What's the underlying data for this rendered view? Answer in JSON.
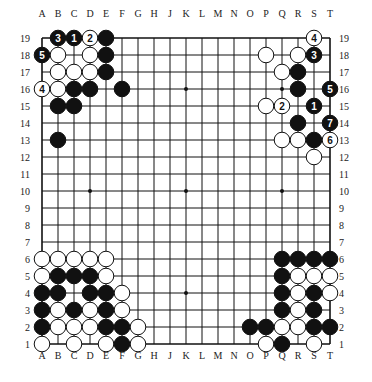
{
  "diagram": {
    "type": "go-board",
    "size": 19,
    "colors": {
      "black": "#111111",
      "white": "#ffffff",
      "line": "#111111",
      "background": "#ffffff"
    },
    "column_labels": [
      "A",
      "B",
      "C",
      "D",
      "E",
      "F",
      "G",
      "H",
      "J",
      "K",
      "L",
      "M",
      "N",
      "O",
      "P",
      "Q",
      "R",
      "S",
      "T"
    ],
    "row_labels": [
      "19",
      "18",
      "17",
      "16",
      "15",
      "14",
      "13",
      "12",
      "11",
      "10",
      "9",
      "8",
      "7",
      "6",
      "5",
      "4",
      "3",
      "2",
      "1"
    ],
    "star_points": [
      "D16",
      "K16",
      "Q16",
      "D10",
      "K10",
      "Q10",
      "D4",
      "K4",
      "Q4"
    ],
    "stones": [
      {
        "pos": "B19",
        "color": "black",
        "label": "3"
      },
      {
        "pos": "C19",
        "color": "black",
        "label": "1"
      },
      {
        "pos": "D19",
        "color": "white",
        "label": "2"
      },
      {
        "pos": "E19",
        "color": "black",
        "label": ""
      },
      {
        "pos": "A18",
        "color": "black",
        "label": "5"
      },
      {
        "pos": "B18",
        "color": "white",
        "label": ""
      },
      {
        "pos": "D18",
        "color": "white",
        "label": ""
      },
      {
        "pos": "E18",
        "color": "black",
        "label": ""
      },
      {
        "pos": "B17",
        "color": "white",
        "label": ""
      },
      {
        "pos": "C17",
        "color": "white",
        "label": ""
      },
      {
        "pos": "D17",
        "color": "white",
        "label": ""
      },
      {
        "pos": "E17",
        "color": "black",
        "label": ""
      },
      {
        "pos": "A16",
        "color": "white",
        "label": "4"
      },
      {
        "pos": "B16",
        "color": "white",
        "label": ""
      },
      {
        "pos": "C16",
        "color": "black",
        "label": ""
      },
      {
        "pos": "D16",
        "color": "black",
        "label": ""
      },
      {
        "pos": "F16",
        "color": "black",
        "label": ""
      },
      {
        "pos": "B15",
        "color": "black",
        "label": ""
      },
      {
        "pos": "C15",
        "color": "black",
        "label": ""
      },
      {
        "pos": "B13",
        "color": "black",
        "label": ""
      },
      {
        "pos": "S19",
        "color": "white",
        "label": "4"
      },
      {
        "pos": "P18",
        "color": "white",
        "label": ""
      },
      {
        "pos": "R18",
        "color": "white",
        "label": ""
      },
      {
        "pos": "S18",
        "color": "black",
        "label": "3"
      },
      {
        "pos": "Q17",
        "color": "white",
        "label": ""
      },
      {
        "pos": "R17",
        "color": "black",
        "label": ""
      },
      {
        "pos": "R16",
        "color": "black",
        "label": ""
      },
      {
        "pos": "T16",
        "color": "black",
        "label": "5"
      },
      {
        "pos": "P15",
        "color": "white",
        "label": ""
      },
      {
        "pos": "Q15",
        "color": "white",
        "label": "2"
      },
      {
        "pos": "S15",
        "color": "black",
        "label": "1"
      },
      {
        "pos": "R14",
        "color": "black",
        "label": ""
      },
      {
        "pos": "T14",
        "color": "black",
        "label": "7"
      },
      {
        "pos": "Q13",
        "color": "white",
        "label": ""
      },
      {
        "pos": "R13",
        "color": "white",
        "label": ""
      },
      {
        "pos": "S13",
        "color": "black",
        "label": ""
      },
      {
        "pos": "T13",
        "color": "white",
        "label": "6"
      },
      {
        "pos": "S12",
        "color": "white",
        "label": ""
      },
      {
        "pos": "A6",
        "color": "white",
        "label": ""
      },
      {
        "pos": "B6",
        "color": "white",
        "label": ""
      },
      {
        "pos": "C6",
        "color": "white",
        "label": ""
      },
      {
        "pos": "D6",
        "color": "white",
        "label": ""
      },
      {
        "pos": "E6",
        "color": "white",
        "label": ""
      },
      {
        "pos": "A5",
        "color": "white",
        "label": ""
      },
      {
        "pos": "B5",
        "color": "black",
        "label": ""
      },
      {
        "pos": "C5",
        "color": "black",
        "label": ""
      },
      {
        "pos": "D5",
        "color": "black",
        "label": ""
      },
      {
        "pos": "E5",
        "color": "white",
        "label": ""
      },
      {
        "pos": "A4",
        "color": "black",
        "label": ""
      },
      {
        "pos": "B4",
        "color": "black",
        "label": ""
      },
      {
        "pos": "D4",
        "color": "black",
        "label": ""
      },
      {
        "pos": "E4",
        "color": "black",
        "label": ""
      },
      {
        "pos": "F4",
        "color": "white",
        "label": ""
      },
      {
        "pos": "A3",
        "color": "black",
        "label": ""
      },
      {
        "pos": "B3",
        "color": "white",
        "label": ""
      },
      {
        "pos": "C3",
        "color": "black",
        "label": ""
      },
      {
        "pos": "D3",
        "color": "white",
        "label": ""
      },
      {
        "pos": "E3",
        "color": "black",
        "label": ""
      },
      {
        "pos": "F3",
        "color": "white",
        "label": ""
      },
      {
        "pos": "A2",
        "color": "black",
        "label": ""
      },
      {
        "pos": "B2",
        "color": "white",
        "label": ""
      },
      {
        "pos": "C2",
        "color": "white",
        "label": ""
      },
      {
        "pos": "D2",
        "color": "white",
        "label": ""
      },
      {
        "pos": "E2",
        "color": "black",
        "label": ""
      },
      {
        "pos": "F2",
        "color": "black",
        "label": ""
      },
      {
        "pos": "G2",
        "color": "white",
        "label": ""
      },
      {
        "pos": "A1",
        "color": "white",
        "label": ""
      },
      {
        "pos": "C1",
        "color": "white",
        "label": ""
      },
      {
        "pos": "E1",
        "color": "white",
        "label": ""
      },
      {
        "pos": "F1",
        "color": "black",
        "label": ""
      },
      {
        "pos": "G1",
        "color": "white",
        "label": ""
      },
      {
        "pos": "Q6",
        "color": "black",
        "label": ""
      },
      {
        "pos": "R6",
        "color": "black",
        "label": ""
      },
      {
        "pos": "S6",
        "color": "black",
        "label": ""
      },
      {
        "pos": "T6",
        "color": "black",
        "label": ""
      },
      {
        "pos": "Q5",
        "color": "black",
        "label": ""
      },
      {
        "pos": "R5",
        "color": "white",
        "label": ""
      },
      {
        "pos": "S5",
        "color": "white",
        "label": ""
      },
      {
        "pos": "T5",
        "color": "white",
        "label": ""
      },
      {
        "pos": "Q4",
        "color": "black",
        "label": ""
      },
      {
        "pos": "R4",
        "color": "white",
        "label": ""
      },
      {
        "pos": "S4",
        "color": "black",
        "label": ""
      },
      {
        "pos": "T4",
        "color": "white",
        "label": ""
      },
      {
        "pos": "Q3",
        "color": "black",
        "label": ""
      },
      {
        "pos": "R3",
        "color": "white",
        "label": ""
      },
      {
        "pos": "S3",
        "color": "black",
        "label": ""
      },
      {
        "pos": "O2",
        "color": "black",
        "label": ""
      },
      {
        "pos": "P2",
        "color": "black",
        "label": ""
      },
      {
        "pos": "Q2",
        "color": "white",
        "label": ""
      },
      {
        "pos": "R2",
        "color": "white",
        "label": ""
      },
      {
        "pos": "S2",
        "color": "black",
        "label": ""
      },
      {
        "pos": "T2",
        "color": "black",
        "label": ""
      },
      {
        "pos": "P1",
        "color": "white",
        "label": ""
      },
      {
        "pos": "Q1",
        "color": "black",
        "label": ""
      },
      {
        "pos": "S1",
        "color": "white",
        "label": ""
      }
    ]
  }
}
